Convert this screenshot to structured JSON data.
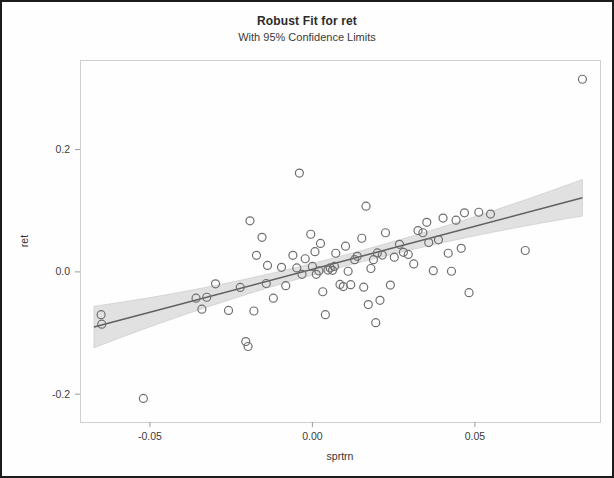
{
  "chart_data": {
    "type": "scatter",
    "title": "Robust Fit for ret",
    "subtitle": "With 95% Confidence Limits",
    "xlabel": "sprtrn",
    "ylabel": "ret",
    "xlim": [
      -0.0715,
      0.0885
    ],
    "ylim": [
      -0.2455,
      0.3465
    ],
    "xticks": [
      -0.05,
      0.0,
      0.05
    ],
    "xtick_labels": [
      "-0.05",
      "0.00",
      "0.05"
    ],
    "yticks": [
      0.2,
      0.0,
      -0.2
    ],
    "ytick_labels": [
      "0.2",
      "0.0",
      "-0.2"
    ],
    "grid": false,
    "legend": false,
    "marker": "open-circle",
    "marker_color": "#6f6f6f",
    "fit_line_color": "#5f5f5f",
    "confidence_band_color": "#cfcfcf",
    "confidence_level": 0.95,
    "fit_line": {
      "x_start": -0.0672,
      "y_start": -0.0902,
      "x_end": 0.0831,
      "y_end": 0.1212
    },
    "confidence_band_halfwidth": {
      "at_x_start": 0.034,
      "at_x_center": 0.0092,
      "at_x_end": 0.03
    },
    "points": [
      [
        -0.065,
        -0.07
      ],
      [
        -0.0648,
        -0.0855
      ],
      [
        -0.052,
        -0.207
      ],
      [
        -0.0358,
        -0.043
      ],
      [
        -0.034,
        -0.061
      ],
      [
        -0.0325,
        -0.0415
      ],
      [
        -0.0298,
        -0.0195
      ],
      [
        -0.0258,
        -0.063
      ],
      [
        -0.0222,
        -0.0255
      ],
      [
        -0.0205,
        -0.114
      ],
      [
        -0.0198,
        -0.122
      ],
      [
        -0.0192,
        0.0835
      ],
      [
        -0.018,
        -0.064
      ],
      [
        -0.0172,
        0.027
      ],
      [
        -0.0155,
        0.0565
      ],
      [
        -0.0142,
        -0.019
      ],
      [
        -0.0138,
        0.0105
      ],
      [
        -0.012,
        -0.043
      ],
      [
        -0.0095,
        0.0075
      ],
      [
        -0.0082,
        -0.0225
      ],
      [
        -0.006,
        0.027
      ],
      [
        -0.0048,
        0.0065
      ],
      [
        -0.004,
        0.1615
      ],
      [
        -0.0032,
        -0.004
      ],
      [
        -0.0022,
        0.0215
      ],
      [
        -0.0005,
        0.0615
      ],
      [
        0.0,
        0.009
      ],
      [
        0.0008,
        0.033
      ],
      [
        0.0012,
        -0.004
      ],
      [
        0.002,
        0.0015
      ],
      [
        0.0025,
        0.0465
      ],
      [
        0.0032,
        -0.0325
      ],
      [
        0.004,
        -0.07
      ],
      [
        0.0048,
        0.003
      ],
      [
        0.0055,
        0.0065
      ],
      [
        0.0062,
        0.0025
      ],
      [
        0.0068,
        0.009
      ],
      [
        0.0072,
        0.0305
      ],
      [
        0.0085,
        -0.0205
      ],
      [
        0.0095,
        -0.024
      ],
      [
        0.0102,
        0.042
      ],
      [
        0.011,
        0.001
      ],
      [
        0.0118,
        -0.021
      ],
      [
        0.013,
        0.02
      ],
      [
        0.0138,
        0.0255
      ],
      [
        0.0152,
        0.055
      ],
      [
        0.0158,
        -0.025
      ],
      [
        0.0165,
        0.1075
      ],
      [
        0.0172,
        -0.0535
      ],
      [
        0.018,
        0.0055
      ],
      [
        0.0188,
        0.02
      ],
      [
        0.0195,
        -0.083
      ],
      [
        0.02,
        0.031
      ],
      [
        0.0208,
        -0.0465
      ],
      [
        0.0215,
        0.0275
      ],
      [
        0.0225,
        0.064
      ],
      [
        0.024,
        -0.0215
      ],
      [
        0.0252,
        0.024
      ],
      [
        0.0268,
        0.045
      ],
      [
        0.028,
        0.032
      ],
      [
        0.0295,
        0.0285
      ],
      [
        0.0312,
        0.013
      ],
      [
        0.0325,
        0.0675
      ],
      [
        0.034,
        0.064
      ],
      [
        0.0352,
        0.081
      ],
      [
        0.0358,
        0.048
      ],
      [
        0.0372,
        0.002
      ],
      [
        0.0388,
        0.0525
      ],
      [
        0.0402,
        0.088
      ],
      [
        0.0418,
        0.0305
      ],
      [
        0.0428,
        0.001
      ],
      [
        0.0442,
        0.0845
      ],
      [
        0.0458,
        0.0385
      ],
      [
        0.0468,
        0.0965
      ],
      [
        0.0482,
        -0.034
      ],
      [
        0.0512,
        0.0975
      ],
      [
        0.0548,
        0.0945
      ],
      [
        0.0655,
        0.035
      ],
      [
        0.0831,
        0.315
      ]
    ]
  }
}
